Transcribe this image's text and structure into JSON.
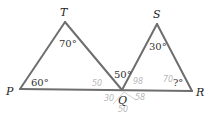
{
  "figure": {
    "vertices": {
      "P": "P",
      "T": "T",
      "Q": "Q",
      "S": "S",
      "R": "R"
    },
    "angles": {
      "angle_P": "60°",
      "angle_T": "70°",
      "angle_TQP_adjacent": "50°",
      "angle_S": "30°",
      "angle_R": "?°"
    },
    "pencil_annotations": {
      "near_PQ": "50",
      "near_QS": "98",
      "near_R": "70",
      "below_Q_left": "30",
      "below_Q_bottom": "50",
      "below_Q_right": "58"
    }
  }
}
